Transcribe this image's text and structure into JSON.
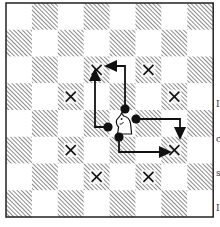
{
  "diagram": {
    "board": {
      "files": 8,
      "ranks": 8,
      "origin": [
        6,
        3
      ],
      "square_w": 25.9,
      "square_h": 26.75,
      "light_color": "#ffffff",
      "dark_hatch_color": "#7a7a7a",
      "border_color": "#222222"
    },
    "piece": {
      "type": "knight",
      "color": "white",
      "row": 4,
      "col": 4
    },
    "targets": [
      {
        "row": 2,
        "col": 3
      },
      {
        "row": 2,
        "col": 5
      },
      {
        "row": 3,
        "col": 2
      },
      {
        "row": 3,
        "col": 6
      },
      {
        "row": 5,
        "col": 2
      },
      {
        "row": 5,
        "col": 6
      },
      {
        "row": 6,
        "col": 3
      },
      {
        "row": 6,
        "col": 5
      }
    ],
    "target_marker": "x-mark",
    "arrows": [
      {
        "name": "arrow-up-left",
        "dot": [
          108,
          127
        ],
        "points": [
          [
            108,
            127
          ],
          [
            95,
            127
          ],
          [
            95,
            80
          ]
        ],
        "head": "up"
      },
      {
        "name": "arrow-up-then-left",
        "dot": [
          125,
          109
        ],
        "points": [
          [
            125,
            109
          ],
          [
            125,
            66
          ],
          [
            116,
            66
          ]
        ],
        "head": "left"
      },
      {
        "name": "arrow-right-then-down",
        "dot": [
          136,
          119
        ],
        "points": [
          [
            136,
            119
          ],
          [
            180,
            119
          ],
          [
            180,
            128
          ]
        ],
        "head": "down"
      },
      {
        "name": "arrow-down-then-right",
        "dot": [
          119,
          137
        ],
        "points": [
          [
            119,
            137
          ],
          [
            119,
            152
          ],
          [
            160,
            152
          ]
        ],
        "head": "right"
      }
    ],
    "side_text_fragments": [
      "I",
      "c",
      "s",
      "I",
      "t",
      "-",
      "a",
      "I",
      "s"
    ]
  }
}
